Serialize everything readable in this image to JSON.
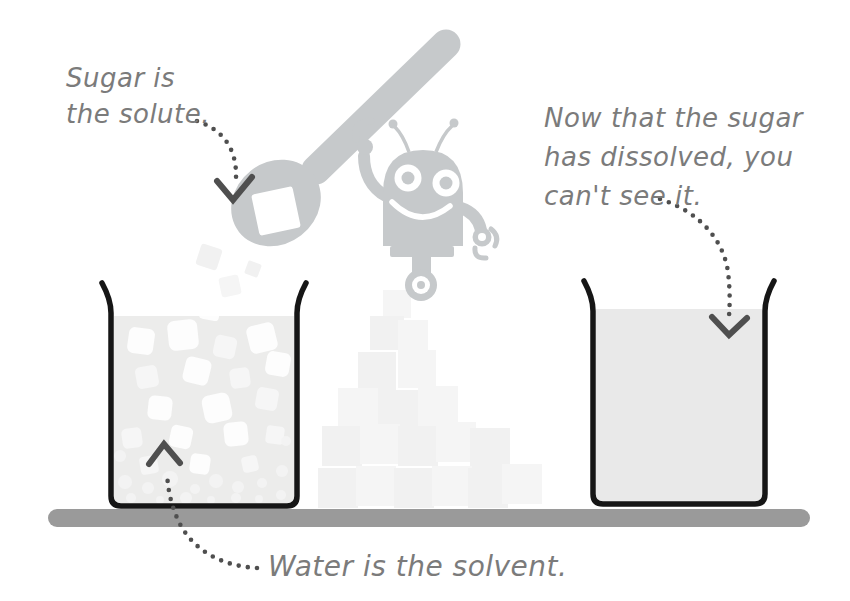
{
  "captions": {
    "solute": "Sugar is\nthe solute.",
    "dissolved": "Now that the sugar\nhas dissolved, you\ncan't see it.",
    "solvent": "Water is the solvent."
  },
  "colors": {
    "background": "#ffffff",
    "caption_text": "#7b7b7b",
    "beaker_outline": "#161616",
    "water_left": "#ececeb",
    "water_right": "#e9e9e9",
    "table": "#9a9a9a",
    "robot": "#c6c9cb",
    "arrow": "#4f4f4f",
    "sugar_cube": "#fdfdfd"
  },
  "icons": {
    "robot": "robot-mascot-icon",
    "spoon": "spoon-icon",
    "sugar_cube_on_spoon": "sugar-cube-icon",
    "arrowheads": "chevron-arrowhead-icon"
  }
}
